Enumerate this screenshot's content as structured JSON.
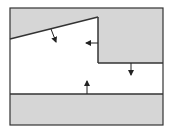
{
  "diagram": {
    "width": 171,
    "height": 131,
    "colors": {
      "background": "#ffffff",
      "region_fill": "#d6d6d6",
      "line": "#333333",
      "arrow": "#222222"
    },
    "frame": {
      "x": 10,
      "y": 8,
      "w": 153,
      "h": 117
    },
    "regions": [
      {
        "name": "upper-shaded-region",
        "points": "10,8 163,8 163,63 98,63 98,17 10,39"
      },
      {
        "name": "lower-shaded-region",
        "points": "10,94 163,94 163,125 10,125"
      }
    ],
    "boundaries": [
      {
        "name": "slanted-boundary",
        "points": "10,39 98,17"
      },
      {
        "name": "vertical-step-boundary",
        "points": "98,17 98,63"
      },
      {
        "name": "horizontal-step-boundary",
        "points": "98,63 163,63"
      },
      {
        "name": "bottom-boundary",
        "points": "10,94 163,94"
      }
    ],
    "arrows": [
      {
        "name": "normal-arrow-slanted",
        "x1": 51,
        "y1": 29,
        "x2": 56,
        "y2": 42
      },
      {
        "name": "normal-arrow-left",
        "x1": 98,
        "y1": 43,
        "x2": 86,
        "y2": 43
      },
      {
        "name": "normal-arrow-down",
        "x1": 131,
        "y1": 63,
        "x2": 131,
        "y2": 75
      },
      {
        "name": "normal-arrow-up",
        "x1": 87,
        "y1": 94,
        "x2": 87,
        "y2": 81
      }
    ]
  }
}
